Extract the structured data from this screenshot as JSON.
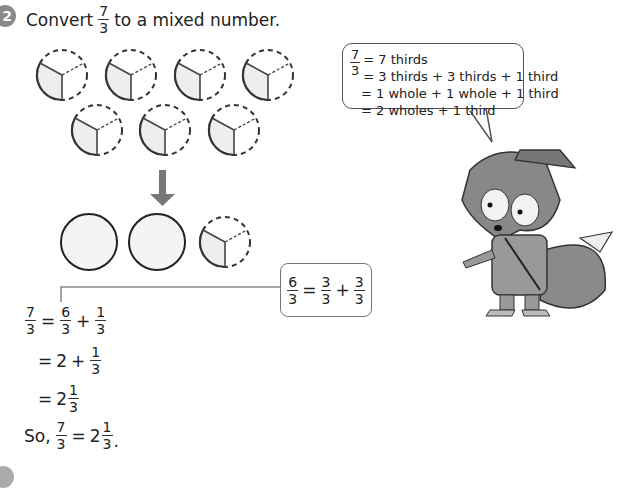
{
  "question": {
    "number": "2",
    "prefix": "Convert",
    "fraction": {
      "num": "7",
      "den": "3"
    },
    "suffix": "to a mixed number."
  },
  "diagram": {
    "thirds_circles_before": 7,
    "arrow": "down-arrow",
    "after": [
      "whole",
      "whole",
      "one-third"
    ]
  },
  "hint_box": {
    "lhs": {
      "num": "6",
      "den": "3"
    },
    "eq": "=",
    "t1": {
      "num": "3",
      "den": "3"
    },
    "plus": "+",
    "t2": {
      "num": "3",
      "den": "3"
    }
  },
  "working": {
    "line1": {
      "lhs": {
        "num": "7",
        "den": "3"
      },
      "eq": "=",
      "a": {
        "num": "6",
        "den": "3"
      },
      "plus": "+",
      "b": {
        "num": "1",
        "den": "3"
      }
    },
    "line2": {
      "eq": "=",
      "whole": "2",
      "plus": "+",
      "b": {
        "num": "1",
        "den": "3"
      }
    },
    "line3": {
      "eq": "=",
      "whole": "2",
      "b": {
        "num": "1",
        "den": "3"
      }
    },
    "line4": {
      "so": "So,",
      "lhs": {
        "num": "7",
        "den": "3"
      },
      "eq": "=",
      "whole": "2",
      "b": {
        "num": "1",
        "den": "3"
      },
      "end": "."
    }
  },
  "speech_bubble": {
    "frac": {
      "num": "7",
      "den": "3"
    },
    "lines": [
      "= 7 thirds",
      "= 3 thirds + 3 thirds + 1 third",
      "= 1 whole + 1 whole + 1 third",
      "= 2 wholes + 1 third"
    ]
  },
  "character": "fox-explorer"
}
